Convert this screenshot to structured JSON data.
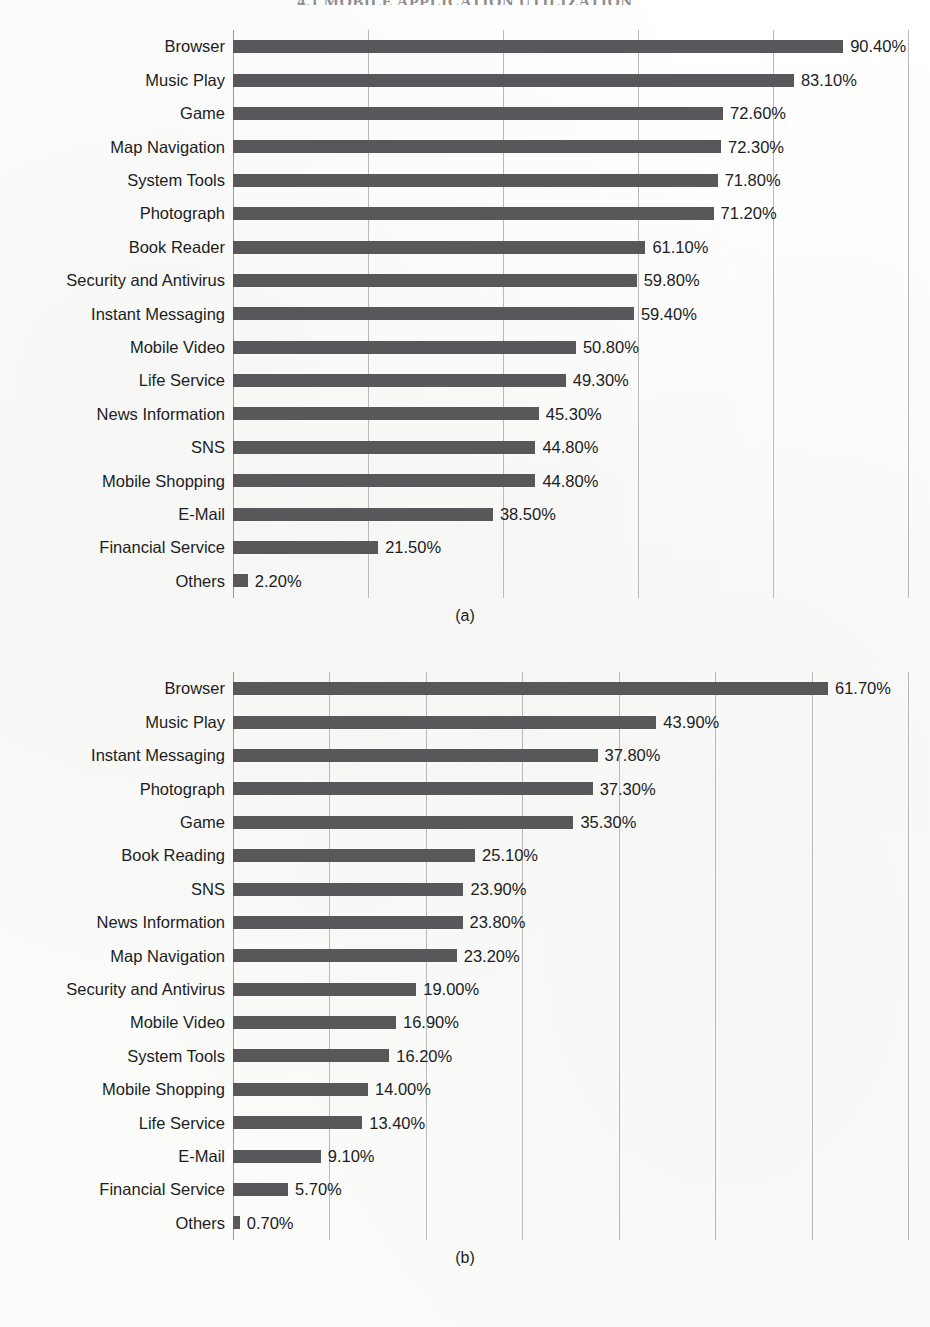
{
  "running_head": "4.1 MOBILE APPLICATION UTILIZATION",
  "figures": {
    "a": {
      "caption": "(a)",
      "axis_max": 100,
      "gridline_step": 20
    },
    "b": {
      "caption": "(b)",
      "axis_max": 70,
      "gridline_step": 10
    }
  },
  "chart_data": [
    {
      "id": "a",
      "type": "bar",
      "orientation": "horizontal",
      "title": "",
      "caption": "(a)",
      "xlabel": "",
      "ylabel": "",
      "xlim": [
        0,
        100
      ],
      "x_tick_step": 20,
      "x_ticks": [
        0,
        20,
        40,
        60,
        80,
        100
      ],
      "tick_labels_shown": false,
      "grid": true,
      "grid_axis": "x",
      "legend": false,
      "value_format": "0.00%",
      "bar_color": "#58585a",
      "categories": [
        "Browser",
        "Music Play",
        "Game",
        "Map Navigation",
        "System Tools",
        "Photograph",
        "Book Reader",
        "Security and Antivirus",
        "Instant Messaging",
        "Mobile Video",
        "Life Service",
        "News Information",
        "SNS",
        "Mobile Shopping",
        "E-Mail",
        "Financial Service",
        "Others"
      ],
      "values": [
        90.4,
        83.1,
        72.6,
        72.3,
        71.8,
        71.2,
        61.1,
        59.8,
        59.4,
        50.8,
        49.3,
        45.3,
        44.8,
        44.8,
        38.5,
        21.5,
        2.2
      ],
      "data_labels": [
        "90.40%",
        "83.10%",
        "72.60%",
        "72.30%",
        "71.80%",
        "71.20%",
        "61.10%",
        "59.80%",
        "59.40%",
        "50.80%",
        "49.30%",
        "45.30%",
        "44.80%",
        "44.80%",
        "38.50%",
        "21.50%",
        "2.20%"
      ]
    },
    {
      "id": "b",
      "type": "bar",
      "orientation": "horizontal",
      "title": "",
      "caption": "(b)",
      "xlabel": "",
      "ylabel": "",
      "xlim": [
        0,
        70
      ],
      "x_tick_step": 10,
      "x_ticks": [
        0,
        10,
        20,
        30,
        40,
        50,
        60,
        70
      ],
      "tick_labels_shown": false,
      "grid": true,
      "grid_axis": "x",
      "legend": false,
      "value_format": "0.00%",
      "bar_color": "#58585a",
      "categories": [
        "Browser",
        "Music Play",
        "Instant Messaging",
        "Photograph",
        "Game",
        "Book Reading",
        "SNS",
        "News Information",
        "Map Navigation",
        "Security and Antivirus",
        "Mobile Video",
        "System Tools",
        "Mobile Shopping",
        "Life Service",
        "E-Mail",
        "Financial Service",
        "Others"
      ],
      "values": [
        61.7,
        43.9,
        37.8,
        37.3,
        35.3,
        25.1,
        23.9,
        23.8,
        23.2,
        19.0,
        16.9,
        16.2,
        14.0,
        13.4,
        9.1,
        5.7,
        0.7
      ],
      "data_labels": [
        "61.70%",
        "43.90%",
        "37.80%",
        "37.30%",
        "35.30%",
        "25.10%",
        "23.90%",
        "23.80%",
        "23.20%",
        "19.00%",
        "16.90%",
        "16.20%",
        "14.00%",
        "13.40%",
        "9.10%",
        "5.70%",
        "0.70%"
      ]
    }
  ]
}
